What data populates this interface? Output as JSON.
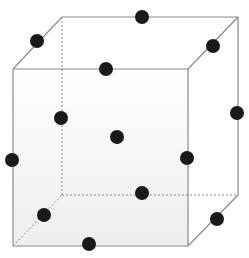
{
  "diagram": {
    "type": "crystal-lattice-cube",
    "colors": {
      "edge": "#8a8a8a",
      "hidden_edge": "#8a8a8a",
      "face_fill_top": "#ffffff",
      "face_fill_bottom": "#eeeeee",
      "atom": "#1a1a1a"
    },
    "front_face": {
      "x1": 13,
      "y1": 69,
      "x2": 188,
      "y2": 246
    },
    "back_face": {
      "x1": 62,
      "y1": 17,
      "x2": 238,
      "y2": 195
    },
    "atoms": [
      {
        "id": "back-top-edge",
        "cx": 142,
        "cy": 17
      },
      {
        "id": "left-top-depth-edge",
        "cx": 37,
        "cy": 41
      },
      {
        "id": "right-top-depth-edge",
        "cx": 213,
        "cy": 46
      },
      {
        "id": "front-top-edge",
        "cx": 106,
        "cy": 69
      },
      {
        "id": "back-left-edge",
        "cx": 61,
        "cy": 118
      },
      {
        "id": "back-right-edge",
        "cx": 237,
        "cy": 113
      },
      {
        "id": "body-center",
        "cx": 117,
        "cy": 137
      },
      {
        "id": "front-left-edge",
        "cx": 12,
        "cy": 160
      },
      {
        "id": "front-right-edge",
        "cx": 187,
        "cy": 158
      },
      {
        "id": "back-bottom-edge",
        "cx": 142,
        "cy": 193
      },
      {
        "id": "left-bottom-depth-edge",
        "cx": 44,
        "cy": 215
      },
      {
        "id": "right-bottom-depth-edge",
        "cx": 217,
        "cy": 219
      },
      {
        "id": "front-bottom-edge",
        "cx": 89,
        "cy": 244
      }
    ],
    "atom_radius": 7
  }
}
